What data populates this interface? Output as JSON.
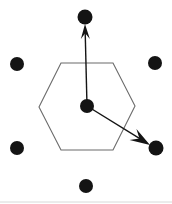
{
  "figure": {
    "background_color": "#ffffff",
    "point_color": "#141414",
    "line_color": "#6b6b6b",
    "arrow_color": "#141414",
    "width": 172,
    "height": 204
  },
  "geometry": {
    "lattice_points": [
      {
        "name": "top",
        "cx": 85,
        "cy": 17,
        "r": 7.5,
        "label": ""
      },
      {
        "name": "upper-left",
        "cx": 17,
        "cy": 64,
        "r": 7.0,
        "label": ""
      },
      {
        "name": "upper-right",
        "cx": 155,
        "cy": 63,
        "r": 7.0,
        "label": ""
      },
      {
        "name": "center",
        "cx": 87,
        "cy": 106,
        "r": 7.0,
        "label": ""
      },
      {
        "name": "lower-left",
        "cx": 17,
        "cy": 148,
        "r": 7.0,
        "label": ""
      },
      {
        "name": "lower-right",
        "cx": 156,
        "cy": 148,
        "r": 7.5,
        "label": ""
      },
      {
        "name": "bottom",
        "cx": 86,
        "cy": 186,
        "r": 7.0,
        "label": ""
      }
    ],
    "hexagon_points": "61,63 113,63 135,106 113,150 61,150 39,107",
    "hexagon_stroke_width": 1.1,
    "vectors": [
      {
        "name": "vector-up",
        "x1": 87,
        "y1": 106,
        "x2": 85,
        "y2": 24,
        "label": "",
        "head_length": 15,
        "head_width": 9
      },
      {
        "name": "vector-down-right",
        "x1": 87,
        "y1": 106,
        "x2": 150,
        "y2": 145,
        "label": "",
        "head_length": 20,
        "head_width": 13
      }
    ],
    "baseline": {
      "x1": 0,
      "y1": 202,
      "x2": 172,
      "y2": 202,
      "color": "#d8d8d8"
    }
  }
}
